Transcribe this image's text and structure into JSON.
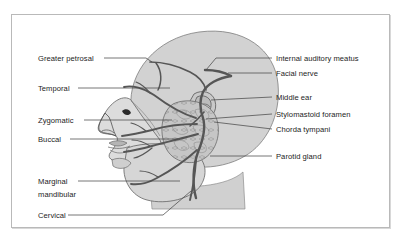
{
  "figure": {
    "frame": {
      "border_color": "#b9b9b9",
      "background": "#ffffff"
    },
    "colors": {
      "head_fill": "#d2d2d2",
      "face_fill": "#dcdcdc",
      "parotid_fill": "#c6c6c6",
      "nerve_stroke": "#5a5a5a",
      "outline_stroke": "#4a4a4a",
      "leader_stroke": "#4a4a4a",
      "text": "#1c1c1c"
    }
  },
  "labels": {
    "left": [
      {
        "id": "greater-petrosal",
        "text": "Greater petrosal",
        "x": 38,
        "y": 54
      },
      {
        "id": "temporal",
        "text": "Temporal",
        "x": 38,
        "y": 84
      },
      {
        "id": "zygomatic",
        "text": "Zygomatic",
        "x": 38,
        "y": 116
      },
      {
        "id": "buccal",
        "text": "Buccal",
        "x": 38,
        "y": 135
      },
      {
        "id": "marginal-mandibular",
        "text": "Marginal",
        "x": 38,
        "y": 177
      },
      {
        "id": "marginal-mandibular-2",
        "text": "mandibular",
        "x": 38,
        "y": 190
      },
      {
        "id": "cervical",
        "text": "Cervical",
        "x": 38,
        "y": 211
      }
    ],
    "right": [
      {
        "id": "internal-auditory-meatus",
        "text": "Internal auditory meatus",
        "x": 276,
        "y": 54
      },
      {
        "id": "facial-nerve",
        "text": "Facial nerve",
        "x": 276,
        "y": 69
      },
      {
        "id": "middle-ear",
        "text": "Middle ear",
        "x": 276,
        "y": 93
      },
      {
        "id": "stylomastoid-foramen",
        "text": "Stylomastoid foramen",
        "x": 276,
        "y": 110
      },
      {
        "id": "chorda-tympani",
        "text": "Chorda tympani",
        "x": 276,
        "y": 125
      },
      {
        "id": "parotid-gland",
        "text": "Parotid gland",
        "x": 276,
        "y": 152
      }
    ]
  },
  "leader_lines": {
    "left": [
      {
        "id": "leader-greater-petrosal",
        "d": "M 104 58 L 148 58 L 160 70"
      },
      {
        "id": "leader-temporal",
        "d": "M 78 88 L 170 88"
      },
      {
        "id": "leader-zygomatic",
        "d": "M 84 120 L 160 120"
      },
      {
        "id": "leader-buccal",
        "d": "M 70 139 L 175 139"
      },
      {
        "id": "leader-marginal-mandibular",
        "d": "M 75 181 L 176 181"
      },
      {
        "id": "leader-cervical",
        "d": "M 68 215 L 160 215 L 186 192"
      }
    ],
    "right": [
      {
        "id": "leader-internal-auditory-meatus",
        "d": "M 270 58 L 212 58 L 202 70"
      },
      {
        "id": "leader-facial-nerve",
        "d": "M 270 73 L 218 73"
      },
      {
        "id": "leader-middle-ear",
        "d": "M 270 97 L 205 97"
      },
      {
        "id": "leader-stylomastoid-foramen",
        "d": "M 270 114 L 203 114"
      },
      {
        "id": "leader-chorda-tympani",
        "d": "M 270 129 L 207 120"
      },
      {
        "id": "leader-parotid-gland",
        "d": "M 270 156 L 200 156"
      }
    ]
  },
  "anatomy": {
    "head_outline": "M 128 106 C 126 74, 152 40, 196 33 C 243 26, 272 48, 276 82 C 280 114, 268 140, 248 152 L 238 176 L 236 206 L 152 206 L 150 183 C 146 170, 136 150, 130 132 Z",
    "skull_fill": "M 132 104 C 130 72, 156 40, 198 34 C 242 28, 270 50, 273 83 C 276 113, 263 139, 244 150 L 150 150 C 142 134, 134 120, 132 104 Z",
    "face_profile": "M 130 104 C 126 95, 112 100, 104 112 C 98 122, 96 128, 100 131 C 104 134, 112 133, 116 136 C 118 141, 113 148, 110 152 C 107 157, 111 160, 118 161 C 124 162, 126 166, 126 172 C 127 182, 136 192, 150 196 L 162 196 L 166 176 L 158 150 L 144 124 Z",
    "jaw": "M 126 150 C 140 146, 168 146, 186 152 C 200 157, 204 170, 198 182 C 190 196, 166 202, 148 198 C 132 194, 124 178, 124 166 Z",
    "parotid": "M 176 106 C 190 100, 208 104, 214 116 C 220 128, 216 146, 204 154 C 192 162, 176 158, 170 148 C 163 136, 164 114, 176 106 Z",
    "neck": "M 150 183 L 152 208 L 240 208 L 238 176 C 226 186, 188 190, 150 183 Z",
    "ear": "M 196 96 C 202 92, 210 94, 212 100 C 214 107, 209 114, 202 114 C 195 114, 191 108, 192 103 Z",
    "facial_nerve_trunk": "M 150 62 C 162 62, 176 66, 186 72 C 196 78, 202 86, 204 94 C 206 103, 204 112, 200 120 C 196 130, 192 142, 190 155 C 188 170, 192 184, 200 192",
    "nerve_branches": [
      {
        "id": "greater-petrosal-branch",
        "d": "M 152 62 C 158 70, 158 80, 156 88"
      },
      {
        "id": "temporal-branch",
        "d": "M 186 114 C 172 110, 156 100, 146 92 C 138 86, 130 84, 124 86"
      },
      {
        "id": "zygomatic-branch",
        "d": "M 186 118 C 172 118, 156 120, 144 124 C 134 127, 126 130, 120 132"
      },
      {
        "id": "buccal-branch",
        "d": "M 188 128 C 174 132, 158 136, 146 140 C 136 143, 128 146, 122 148"
      },
      {
        "id": "marginal-branch",
        "d": "M 190 146 C 178 154, 164 164, 152 172 C 144 177, 136 181, 130 183"
      },
      {
        "id": "cervical-branch",
        "d": "M 190 156 C 190 170, 190 184, 188 196"
      },
      {
        "id": "chorda-tympani-branch",
        "d": "M 204 112 C 200 118, 196 124, 192 128"
      }
    ]
  }
}
